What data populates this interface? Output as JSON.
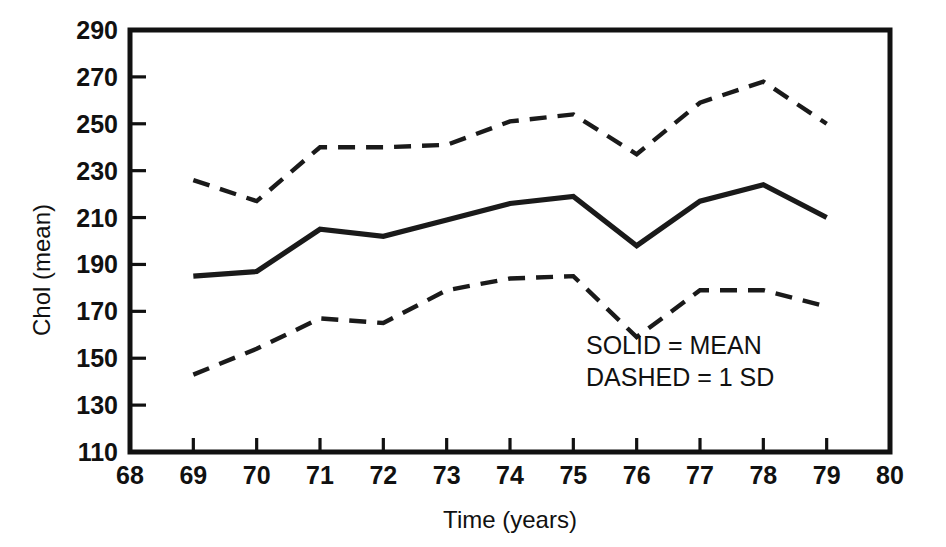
{
  "chart_data": {
    "type": "line",
    "title": "",
    "xlabel": "Time (years)",
    "ylabel": "Chol (mean)",
    "xlim": [
      68,
      80
    ],
    "ylim": [
      110,
      290
    ],
    "xticks": [
      68,
      69,
      70,
      71,
      72,
      73,
      74,
      75,
      76,
      77,
      78,
      79,
      80
    ],
    "yticks": [
      110,
      130,
      150,
      170,
      190,
      210,
      230,
      250,
      270,
      290
    ],
    "grid": false,
    "legend_position": "inside-lower-right",
    "x": [
      69,
      70,
      71,
      72,
      73,
      74,
      75,
      76,
      77,
      78,
      79
    ],
    "series": [
      {
        "name": "Mean",
        "style": "solid",
        "values": [
          185,
          187,
          205,
          202,
          209,
          216,
          219,
          198,
          217,
          224,
          210
        ]
      },
      {
        "name": "Mean + 1 SD",
        "style": "dashed",
        "values": [
          226,
          217,
          240,
          240,
          241,
          251,
          254,
          237,
          259,
          268,
          250
        ]
      },
      {
        "name": "Mean - 1 SD",
        "style": "dashed",
        "values": [
          143,
          154,
          167,
          165,
          179,
          184,
          185,
          159,
          179,
          179,
          172
        ]
      }
    ],
    "annotations": [
      {
        "text": "SOLID = MEAN",
        "x": 75.2,
        "y": 152
      },
      {
        "text": "DASHED = 1 SD",
        "x": 75.2,
        "y": 138
      }
    ],
    "colors": {
      "line": "#1a1a1a",
      "axis": "#111111",
      "background": "#ffffff"
    }
  }
}
